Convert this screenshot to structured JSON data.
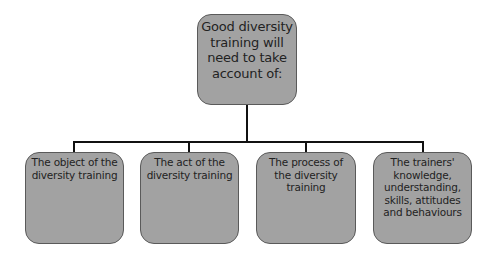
{
  "diagram": {
    "type": "hierarchy",
    "root": {
      "label": "Good diversity\ntraining will\nneed to take\naccount of:"
    },
    "children": [
      {
        "label": "The object of the\ndiversity training"
      },
      {
        "label": "The act of the\ndiversity training"
      },
      {
        "label": "The process of\nthe diversity\ntraining"
      },
      {
        "label": "The trainers'\nknowledge,\nunderstanding,\nskills, attitudes\nand behaviours"
      }
    ],
    "colors": {
      "box_fill": "#a2a2a2",
      "box_border": "#5a5a5a",
      "connector": "#111111",
      "text": "#222222",
      "background": "#ffffff"
    }
  }
}
